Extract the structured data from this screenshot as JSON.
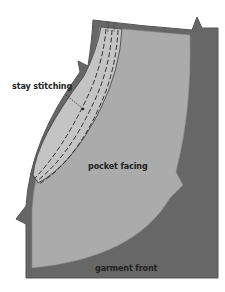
{
  "diagram": {
    "type": "sewing-pattern-illustration",
    "labels": {
      "stay_stitching": "stay stitching",
      "pocket_facing": "pocket facing",
      "garment_front": "garment front"
    },
    "colors": {
      "garment_front": "#676767",
      "garment_edge": "#555555",
      "pocket_facing": "#ababab",
      "stitch_band": "#c8c8c8",
      "stitch_line": "#3a3a3a",
      "text": "#222222",
      "background": "#ffffff"
    }
  }
}
